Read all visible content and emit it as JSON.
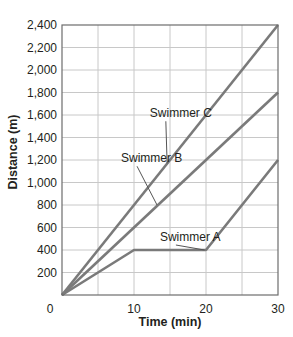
{
  "chart_data": {
    "type": "line",
    "title": "",
    "xlabel": "Time (min)",
    "ylabel": "Distance (m)",
    "xlim": [
      0,
      30
    ],
    "ylim": [
      0,
      2400
    ],
    "x_ticks": [
      0,
      10,
      20,
      30
    ],
    "x_tick_labels": [
      "0",
      "10",
      "20",
      "30"
    ],
    "y_ticks": [
      200,
      400,
      600,
      800,
      1000,
      1200,
      1400,
      1600,
      1800,
      2000,
      2200,
      2400
    ],
    "y_tick_labels": [
      "200",
      "400",
      "600",
      "800",
      "1,000",
      "1,200",
      "1,400",
      "1,600",
      "1,800",
      "2,000",
      "2,200",
      "2,400"
    ],
    "origin_label": "0",
    "grid": true,
    "grid_x_step": 5,
    "grid_y_step": 200,
    "legend": "inline labels with leader lines",
    "series": [
      {
        "name": "Swimmer A",
        "x": [
          0,
          10,
          20,
          30
        ],
        "y": [
          0,
          400,
          400,
          1200
        ],
        "color": "#7a7a7a"
      },
      {
        "name": "Swimmer B",
        "x": [
          0,
          30
        ],
        "y": [
          0,
          1800
        ],
        "color": "#7a7a7a"
      },
      {
        "name": "Swimmer C",
        "x": [
          0,
          30
        ],
        "y": [
          0,
          2400
        ],
        "color": "#7a7a7a"
      }
    ],
    "annotations": [
      {
        "text": "Swimmer C",
        "label_x": 12.2,
        "label_y": 1580,
        "point_x": 14.6,
        "point_y": 1170
      },
      {
        "text": "Swimmer B",
        "label_x": 8.2,
        "label_y": 1180,
        "point_x": 13.2,
        "point_y": 800
      },
      {
        "text": "Swimmer A",
        "label_x": 13.6,
        "label_y": 480,
        "point_x": 19.8,
        "point_y": 400
      }
    ]
  },
  "colors": {
    "line": "#7a7a7a",
    "grid": "#c8c8c8",
    "axis": "#6d6d6d",
    "text": "#231f20"
  }
}
